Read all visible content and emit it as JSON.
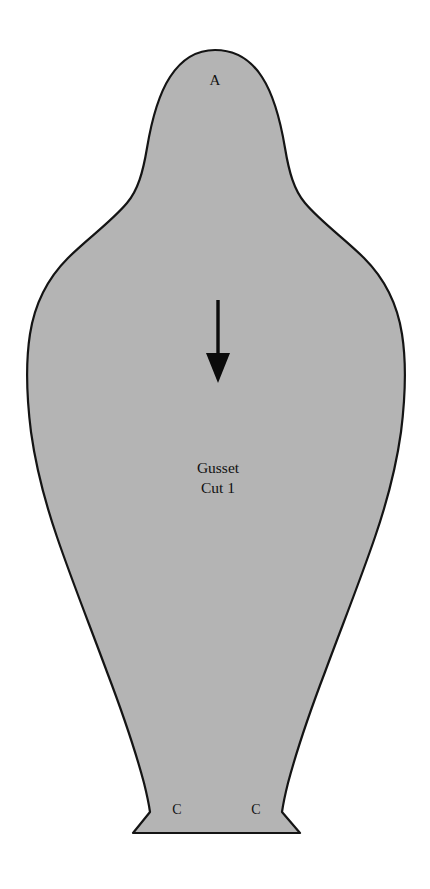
{
  "document": {
    "type": "sewing-pattern-piece",
    "page_background": "#ffffff"
  },
  "piece": {
    "name": "Gusset",
    "fill_color": "#b4b4b4",
    "outline_color": "#141414",
    "outline_width": 2.2,
    "title_line_1": "Gusset",
    "title_line_2": "Cut 1",
    "title_x": 218,
    "title_y_1": 473,
    "title_y_2": 493
  },
  "labels": {
    "apex": {
      "text": "A",
      "x": 215,
      "y": 85
    },
    "bottom_left": {
      "text": "C",
      "x": 177,
      "y": 814
    },
    "bottom_right": {
      "text": "C",
      "x": 256,
      "y": 814
    }
  },
  "grain_arrow": {
    "name": "grain-line-arrow",
    "direction": "down",
    "shaft_x": 218,
    "shaft_y_start": 300,
    "shaft_y_end": 356,
    "head_left_x": 206,
    "head_right_x": 230,
    "head_top_y": 353,
    "head_tip_y": 383,
    "color": "#0b0b0b"
  },
  "geometry": {
    "outline_path": "M 215 50 C 236 50 251 60 262 77 C 275 97 281 124 285 148 C 289 172 294 190 305 203 C 321 222 345 239 364 258 C 384 278 397 302 402 334 C 407 366 405 400 401 432 C 396 468 387 502 375 537 C 360 581 342 626 325 672 C 309 714 296 753 288 783 C 285 795 283 805 282 812 L 300 833 L 133 833 L 150 812 C 149 805 147 795 144 783 C 136 753 123 714 107 672 C 90 626 72 581 57 537 C 45 502 36 468 31 432 C 27 400 25 366 30 334 C 35 302 48 278 68 258 C 87 239 111 222 127 203 C 138 190 143 172 147 148 C 151 124 157 97 170 77 C 181 60 196 50 215 50 Z",
    "top_apex": {
      "x": 215,
      "y": 50
    },
    "widest_left": {
      "x": 27,
      "y": 400
    },
    "widest_right": {
      "x": 403,
      "y": 400
    },
    "bottom_edge_y": 833,
    "bottom_left_corner": {
      "x": 133,
      "y": 833
    },
    "bottom_right_corner": {
      "x": 300,
      "y": 833
    }
  }
}
